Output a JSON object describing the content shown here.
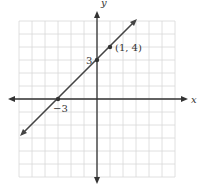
{
  "chart_data": {
    "type": "line",
    "title": "",
    "xlabel": "x",
    "ylabel": "y",
    "xlim": [
      -6,
      6
    ],
    "ylim": [
      -6,
      6
    ],
    "grid": true,
    "series": [
      {
        "name": "y = x + 3",
        "x": [
          -5.5,
          5.5
        ],
        "y": [
          -2.5,
          8.5
        ],
        "color": "#444444"
      }
    ],
    "points": [
      {
        "x": 0,
        "y": 3,
        "label": "3"
      },
      {
        "x": -3,
        "y": 0,
        "label": "−3"
      },
      {
        "x": 1,
        "y": 4,
        "label": "(1, 4)"
      }
    ]
  },
  "labels": {
    "x_axis": "x",
    "y_axis": "y",
    "y_intercept": "3",
    "x_intercept": "−3",
    "point": "(1, 4)"
  },
  "colors": {
    "grid": "#d8d8d8",
    "axis": "#333333",
    "line": "#444444"
  }
}
